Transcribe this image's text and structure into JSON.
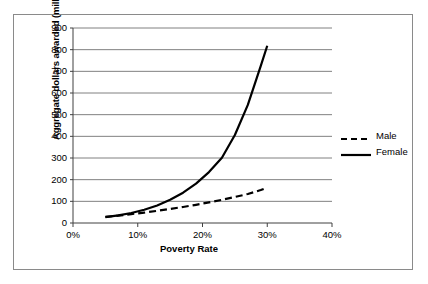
{
  "chart_data": {
    "type": "line",
    "title": "",
    "xlabel": "Poverty Rate",
    "ylabel": "Aggregate dollars awarded (millions)",
    "xlim": [
      0,
      40
    ],
    "ylim": [
      0,
      900
    ],
    "xtick_labels": [
      "0%",
      "10%",
      "20%",
      "30%",
      "40%"
    ],
    "xtick_values": [
      0,
      10,
      20,
      30,
      40
    ],
    "ytick_labels": [
      "0",
      "100",
      "200",
      "300",
      "400",
      "500",
      "600",
      "700",
      "800",
      "900"
    ],
    "ytick_values": [
      0,
      100,
      200,
      300,
      400,
      500,
      600,
      700,
      800,
      900
    ],
    "grid": "horizontal",
    "legend_position": "right",
    "series": [
      {
        "name": "Male",
        "style": "dashed",
        "color": "#000000",
        "x": [
          5,
          7,
          9,
          11,
          13,
          15,
          17,
          19,
          21,
          23,
          25,
          27,
          29,
          30
        ],
        "values": [
          28,
          34,
          41,
          48,
          56,
          65,
          74,
          84,
          95,
          107,
          120,
          134,
          152,
          163
        ]
      },
      {
        "name": "Female",
        "style": "solid",
        "color": "#000000",
        "x": [
          5,
          7,
          9,
          11,
          13,
          15,
          17,
          19,
          21,
          23,
          25,
          27,
          29,
          30
        ],
        "values": [
          27,
          35,
          46,
          61,
          81,
          107,
          140,
          182,
          235,
          301,
          406,
          545,
          725,
          818
        ]
      }
    ]
  },
  "legend": {
    "items": [
      {
        "label": "Male",
        "style": "dashed"
      },
      {
        "label": "Female",
        "style": "solid"
      }
    ]
  }
}
